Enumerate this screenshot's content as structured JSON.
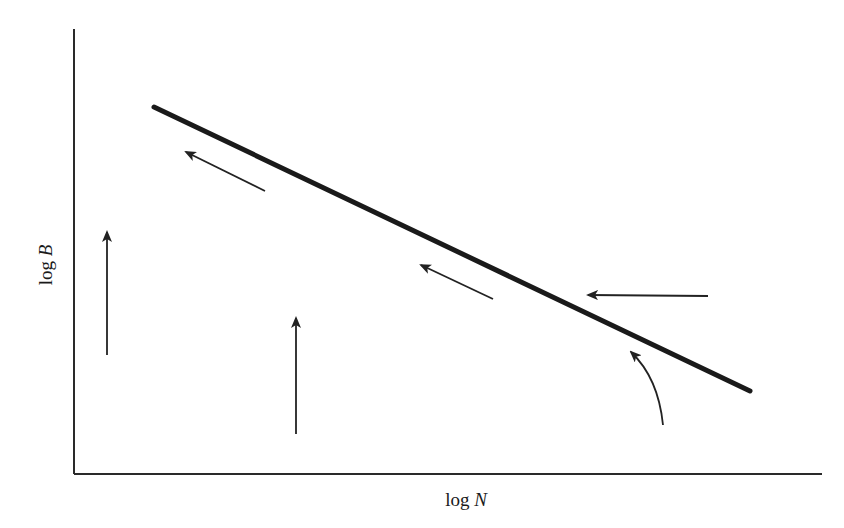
{
  "diagram": {
    "axes": {
      "x_label_prefix": "log",
      "x_label_var": "N",
      "y_label_prefix": "log",
      "y_label_var": "B"
    },
    "colors": {
      "ink": "#1a1a1a",
      "background": "#ffffff"
    },
    "elements": {
      "main_line": {
        "from": [
          154,
          107
        ],
        "to": [
          750,
          391
        ],
        "description": "thick straight line with negative slope (equilibrium line)"
      },
      "arrows": [
        {
          "id": "arrow-upper-left-diagonal",
          "direction": "up-left",
          "from": [
            265,
            191
          ],
          "to": [
            186,
            152
          ]
        },
        {
          "id": "arrow-left-vertical",
          "direction": "up",
          "from": [
            107,
            355
          ],
          "to": [
            107,
            232
          ]
        },
        {
          "id": "arrow-middle-vertical",
          "direction": "up",
          "from": [
            296,
            434
          ],
          "to": [
            296,
            318
          ]
        },
        {
          "id": "arrow-middle-diagonal",
          "direction": "up-left",
          "from": [
            493,
            299
          ],
          "to": [
            421,
            265
          ]
        },
        {
          "id": "arrow-right-horizontal",
          "direction": "left",
          "from": [
            708,
            296
          ],
          "to": [
            588,
            295
          ]
        },
        {
          "id": "arrow-right-curved",
          "direction": "up-left curving",
          "from": [
            663,
            425
          ],
          "to": [
            631,
            352
          ]
        }
      ]
    }
  }
}
